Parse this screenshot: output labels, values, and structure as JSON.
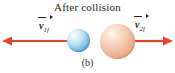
{
  "figure": {
    "title": "After collision",
    "caption": "(b)",
    "background_color": "#ffffff",
    "text_color": "#231f20"
  },
  "labels": {
    "left_velocity": {
      "symbol": "v",
      "subscript": "1f",
      "full": "v1f"
    },
    "right_velocity": {
      "symbol": "v",
      "subscript": "2f",
      "full": "v2f"
    }
  },
  "objects": {
    "ball_left": {
      "name": "blue-ball",
      "color": "#7fc3e8",
      "diameter_px": 23
    },
    "ball_right": {
      "name": "orange-ball",
      "color": "#eeb394",
      "diameter_px": 35
    }
  },
  "vectors": {
    "color": "#e8412c",
    "left_arrow": {
      "direction": "left",
      "x_start": 70,
      "x_end": 3,
      "y": 41
    },
    "right_arrow": {
      "direction": "right",
      "x_start": 134,
      "x_end": 172,
      "y": 41
    }
  }
}
